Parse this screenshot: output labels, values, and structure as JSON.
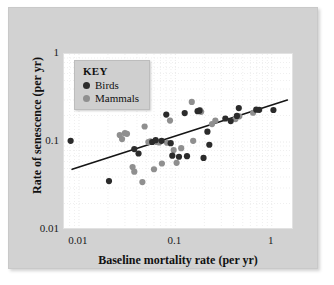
{
  "chart_data": {
    "type": "scatter",
    "title": "",
    "xlabel": "Baseline mortality rate (per yr)",
    "ylabel": "Rate of senescence (per yr)",
    "xscale": "log",
    "yscale": "log",
    "xlim": [
      0.007,
      1.7
    ],
    "ylim": [
      0.01,
      1.0
    ],
    "xticks": [
      "0.01",
      "0.1",
      "1"
    ],
    "xtick_values": [
      0.01,
      0.1,
      1
    ],
    "yticks": [
      "1",
      "0.1",
      "0.01"
    ],
    "ytick_values": [
      1,
      0.1,
      0.01
    ],
    "grid": true,
    "grid_style": "dotted-minor-log",
    "legend": {
      "title": "KEY",
      "position": "top-left",
      "entries": [
        {
          "name": "Birds",
          "color": "#2b2b2b",
          "marker": "circle"
        },
        {
          "name": "Mammals",
          "color": "#8f8f8f",
          "marker": "circle"
        }
      ]
    },
    "annotations": [
      {
        "type": "trendline",
        "label": "",
        "color": "#151515",
        "x0": 0.0085,
        "y0": 0.049,
        "x1": 1.45,
        "y1": 0.3
      }
    ],
    "series": [
      {
        "name": "Birds",
        "color": "#2b2b2b",
        "marker": "circle",
        "points": [
          [
            0.0082,
            0.103
          ],
          [
            0.0205,
            0.036
          ],
          [
            0.0375,
            0.083
          ],
          [
            0.0415,
            0.074
          ],
          [
            0.0575,
            0.1
          ],
          [
            0.0625,
            0.105
          ],
          [
            0.072,
            0.103
          ],
          [
            0.0805,
            0.205
          ],
          [
            0.0895,
            0.097
          ],
          [
            0.093,
            0.07
          ],
          [
            0.109,
            0.068
          ],
          [
            0.125,
            0.213
          ],
          [
            0.132,
            0.069
          ],
          [
            0.17,
            0.224
          ],
          [
            0.178,
            0.227
          ],
          [
            0.196,
            0.066
          ],
          [
            0.215,
            0.131
          ],
          [
            0.225,
            0.093
          ],
          [
            0.33,
            0.185
          ],
          [
            0.375,
            0.173
          ],
          [
            0.435,
            0.198
          ],
          [
            0.455,
            0.243
          ],
          [
            0.69,
            0.233
          ],
          [
            0.74,
            0.232
          ],
          [
            1.04,
            0.231
          ]
        ]
      },
      {
        "name": "Mammals",
        "color": "#8f8f8f",
        "marker": "circle",
        "points": [
          [
            0.0265,
            0.12
          ],
          [
            0.028,
            0.108
          ],
          [
            0.03,
            0.126
          ],
          [
            0.0315,
            0.124
          ],
          [
            0.036,
            0.052
          ],
          [
            0.0375,
            0.046
          ],
          [
            0.0455,
            0.035
          ],
          [
            0.048,
            0.15
          ],
          [
            0.0525,
            0.1
          ],
          [
            0.055,
            0.102
          ],
          [
            0.06,
            0.049
          ],
          [
            0.064,
            0.1
          ],
          [
            0.068,
            0.099
          ],
          [
            0.0725,
            0.057
          ],
          [
            0.082,
            0.098
          ],
          [
            0.088,
            0.175
          ],
          [
            0.096,
            0.081
          ],
          [
            0.103,
            0.058
          ],
          [
            0.115,
            0.085
          ],
          [
            0.148,
            0.285
          ],
          [
            0.153,
            0.103
          ],
          [
            0.18,
            0.23
          ],
          [
            0.185,
            0.22
          ],
          [
            0.24,
            0.16
          ],
          [
            0.26,
            0.175
          ],
          [
            0.42,
            0.182
          ],
          [
            0.46,
            0.196
          ],
          [
            0.64,
            0.215
          ]
        ]
      }
    ]
  }
}
